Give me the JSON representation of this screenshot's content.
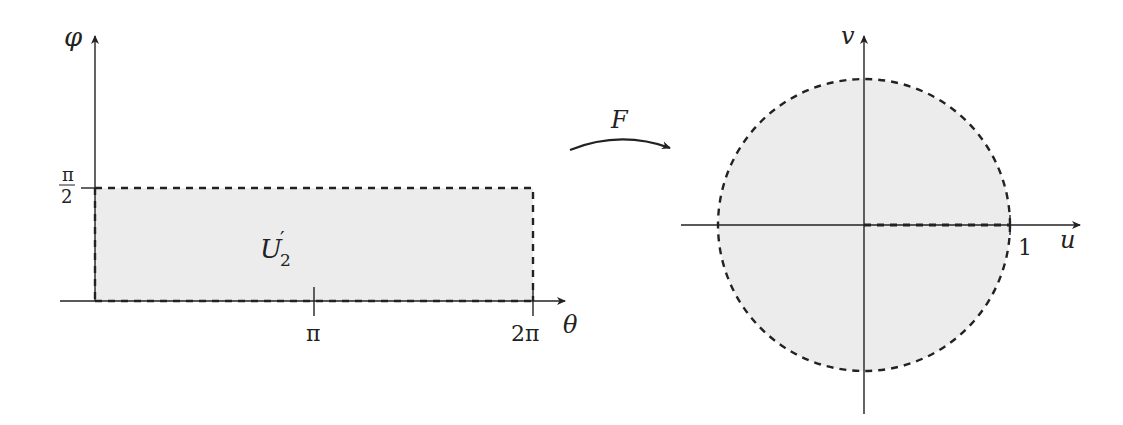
{
  "left_plot": {
    "y_axis_label": "φ",
    "x_axis_label": "θ",
    "y_tick_label_num": "π",
    "y_tick_label_den": "2",
    "x_tick_pi": "π",
    "x_tick_2pi": "2π",
    "region_label": "U",
    "region_label_sub": "2",
    "region_label_prime": "′",
    "region_fill": "#ececec"
  },
  "map_arrow": {
    "label": "F"
  },
  "right_plot": {
    "u_axis_label": "u",
    "v_axis_label": "v",
    "u_tick_1": "1",
    "region_fill": "#ececec"
  },
  "colors": {
    "stroke": "#222222",
    "fill": "#ececec"
  }
}
